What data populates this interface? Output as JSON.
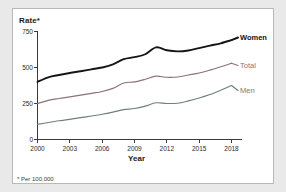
{
  "footnote": "* Per 100,000",
  "colors": {
    "women": "#151515",
    "total": "#8c7279",
    "men": "#6f8079",
    "axis": "#3a3a3a",
    "card_background": "#ffffff",
    "page_background": "#e9e9e9",
    "card_border": "#b9b9b9"
  },
  "chart_data": {
    "type": "line",
    "title": "",
    "xlabel": "Year",
    "ylabel": "Rate*",
    "xlim": [
      2000,
      2018
    ],
    "ylim": [
      0,
      750
    ],
    "grid": false,
    "legend_position": "right-inline",
    "xticks": [
      "2000",
      "2003",
      "2006",
      "2009",
      "2012",
      "2015",
      "2018"
    ],
    "xtick_values": [
      2000,
      2003,
      2006,
      2009,
      2012,
      2015,
      2018
    ],
    "yticks": [
      "0",
      "250",
      "500",
      "750"
    ],
    "ytick_values": [
      0,
      250,
      500,
      750
    ],
    "x": [
      2000,
      2001,
      2002,
      2003,
      2004,
      2005,
      2006,
      2007,
      2008,
      2009,
      2010,
      2011,
      2012,
      2013,
      2014,
      2015,
      2016,
      2017,
      2018
    ],
    "series": [
      {
        "name": "Women",
        "color": "#151515",
        "values": [
          400,
          432,
          448,
          462,
          474,
          487,
          500,
          521,
          558,
          572,
          592,
          640,
          620,
          612,
          618,
          635,
          652,
          668,
          690
        ]
      },
      {
        "name": "Total",
        "color": "#8c7279",
        "values": [
          250,
          272,
          285,
          296,
          308,
          320,
          333,
          355,
          392,
          400,
          418,
          440,
          432,
          434,
          448,
          462,
          482,
          505,
          530
        ]
      },
      {
        "name": "Men",
        "color": "#6f8079",
        "values": [
          105,
          118,
          130,
          140,
          152,
          163,
          175,
          190,
          207,
          215,
          232,
          255,
          250,
          252,
          268,
          288,
          312,
          342,
          375
        ]
      }
    ]
  }
}
